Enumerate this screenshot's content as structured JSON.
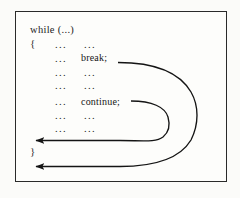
{
  "figure": {
    "background_color": "#fbfbf9",
    "frame_color": "#2a2a2a",
    "ink_color": "#1c1c1c"
  },
  "code": {
    "header": "while (...)",
    "open_brace": "{",
    "close_brace": "}",
    "ellipsis": "...",
    "break_stmt": "break;",
    "continue_stmt": "continue;",
    "lines": [
      {
        "indent_dots": "...",
        "body_dots": "...",
        "statement": ""
      },
      {
        "indent_dots": "...",
        "body_dots": "",
        "statement": "break;"
      },
      {
        "indent_dots": "...",
        "body_dots": "...",
        "statement": ""
      },
      {
        "indent_dots": "...",
        "body_dots": "...",
        "statement": ""
      },
      {
        "indent_dots": "...",
        "body_dots": "",
        "statement": "continue;"
      },
      {
        "indent_dots": "...",
        "body_dots": "...",
        "statement": ""
      },
      {
        "indent_dots": "...",
        "body_dots": "...",
        "statement": ""
      }
    ]
  },
  "arrows": {
    "continue_arrow_label": "continue jumps to loop condition",
    "break_arrow_label": "break exits the loop",
    "stroke_color": "#141414",
    "stroke_width": "1.4"
  }
}
